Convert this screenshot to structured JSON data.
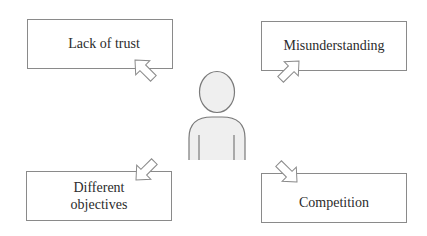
{
  "diagram": {
    "center": {
      "label": "person",
      "icon": "person-icon"
    },
    "boxes": [
      {
        "id": "top-left",
        "label": "Lack of trust",
        "arrow_direction": "up-left"
      },
      {
        "id": "top-right",
        "label": "Misunderstanding",
        "arrow_direction": "up-right"
      },
      {
        "id": "bottom-left",
        "label": "Different\nobjectives",
        "arrow_direction": "down-left"
      },
      {
        "id": "bottom-right",
        "label": "Competition",
        "arrow_direction": "down-right"
      }
    ],
    "colors": {
      "stroke": "#8a8a8a",
      "text": "#2b2b2b",
      "person_fill": "#efefef",
      "person_stroke": "#7a7a7a",
      "background": "#ffffff"
    }
  }
}
